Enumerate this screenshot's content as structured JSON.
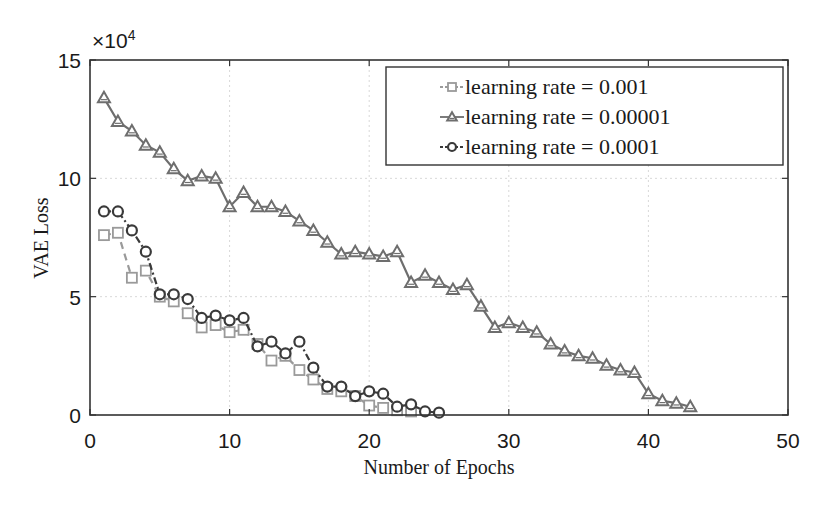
{
  "chart_data": {
    "type": "line",
    "title": "",
    "xlabel": "Number of Epochs",
    "ylabel": "VAE Loss",
    "y_multiplier": "×10^4",
    "xlim": [
      0,
      50
    ],
    "ylim": [
      0,
      15
    ],
    "xticks": [
      0,
      10,
      20,
      30,
      40,
      50
    ],
    "yticks": [
      0,
      5,
      10,
      15
    ],
    "grid": true,
    "legend_position": "upper right",
    "series": [
      {
        "name": "learning rate = 0.001",
        "marker": "square",
        "line_style": "dashed",
        "color": "#9a9a9a",
        "x": [
          1,
          2,
          3,
          4,
          5,
          6,
          7,
          8,
          9,
          10,
          11,
          12,
          13,
          14,
          15,
          16,
          17,
          18,
          19,
          20,
          21,
          22,
          23
        ],
        "values": [
          7.6,
          7.7,
          5.8,
          6.1,
          5.0,
          4.8,
          4.3,
          3.7,
          3.8,
          3.5,
          3.6,
          3.0,
          2.3,
          2.5,
          1.9,
          1.5,
          1.1,
          1.0,
          0.8,
          0.4,
          0.3,
          0.2,
          0.15
        ]
      },
      {
        "name": "learning rate = 0.00001",
        "marker": "triangle",
        "line_style": "solid",
        "color": "#6e6e6e",
        "x": [
          1,
          2,
          3,
          4,
          5,
          6,
          7,
          8,
          9,
          10,
          11,
          12,
          13,
          14,
          15,
          16,
          17,
          18,
          19,
          20,
          21,
          22,
          23,
          24,
          25,
          26,
          27,
          28,
          29,
          30,
          31,
          32,
          33,
          34,
          35,
          36,
          37,
          38,
          39,
          40,
          41,
          42,
          43
        ],
        "values": [
          13.4,
          12.4,
          12.0,
          11.4,
          11.1,
          10.4,
          9.9,
          10.1,
          10.0,
          8.8,
          9.4,
          8.8,
          8.8,
          8.6,
          8.2,
          7.8,
          7.3,
          6.8,
          6.9,
          6.8,
          6.7,
          6.9,
          5.6,
          5.9,
          5.6,
          5.3,
          5.5,
          4.6,
          3.7,
          3.9,
          3.7,
          3.5,
          3.0,
          2.7,
          2.5,
          2.4,
          2.1,
          1.9,
          1.8,
          0.9,
          0.6,
          0.5,
          0.35
        ]
      },
      {
        "name": "learning rate = 0.0001",
        "marker": "circle",
        "line_style": "dash-dot",
        "color": "#3a3a3a",
        "x": [
          1,
          2,
          3,
          4,
          5,
          6,
          7,
          8,
          9,
          10,
          11,
          12,
          13,
          14,
          15,
          16,
          17,
          18,
          19,
          20,
          21,
          22,
          23,
          24,
          25
        ],
        "values": [
          8.6,
          8.6,
          7.8,
          6.9,
          5.1,
          5.1,
          4.9,
          4.1,
          4.2,
          4.0,
          4.1,
          2.9,
          3.1,
          2.6,
          3.1,
          2.0,
          1.2,
          1.2,
          0.8,
          1.0,
          0.9,
          0.35,
          0.45,
          0.15,
          0.1
        ]
      }
    ]
  }
}
